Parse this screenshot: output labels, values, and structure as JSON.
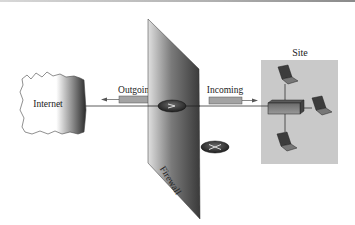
{
  "diagram": {
    "type": "network-firewall",
    "nodes": {
      "internet": {
        "label": "Internet"
      },
      "firewall": {
        "label": "Firewall"
      },
      "site": {
        "label": "Site",
        "laptops": 3,
        "hub": "switch"
      },
      "router_pass": {
        "symbol": ">",
        "state": "allowed"
      },
      "router_block": {
        "symbol": "×",
        "state": "blocked"
      }
    },
    "flows": {
      "outgoing": {
        "label": "Outgoing",
        "direction": "left"
      },
      "incoming": {
        "label": "Incoming",
        "direction": "right"
      }
    },
    "colors": {
      "site_bg": "#c8c8c8",
      "packet": "#a3a3a3",
      "router": "#3a3a3a",
      "firewall_dark": "#3b3b3b",
      "firewall_light": "#d8d8d8"
    }
  }
}
